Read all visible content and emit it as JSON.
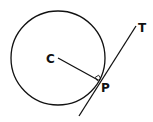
{
  "diagram": {
    "type": "circle-tangent",
    "colors": {
      "stroke": "#111111",
      "background": "#ffffff"
    },
    "labels": {
      "center": "C",
      "point": "P",
      "tangent": "T"
    }
  }
}
